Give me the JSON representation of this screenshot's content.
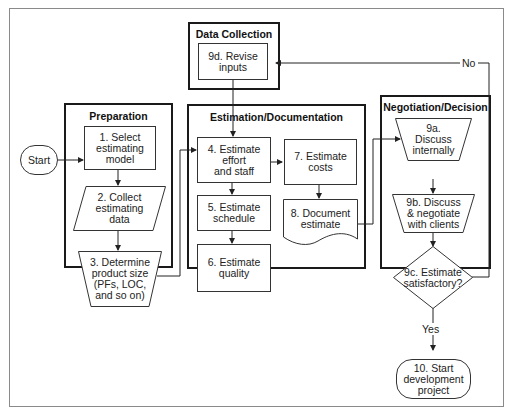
{
  "diagram": {
    "groups": {
      "data_collection": {
        "title": "Data Collection"
      },
      "preparation": {
        "title": "Preparation"
      },
      "estimation": {
        "title": "Estimation/Documentation"
      },
      "negotiation": {
        "title": "Negotiation/Decision"
      }
    },
    "nodes": {
      "start": {
        "label": "Start",
        "shape": "terminator"
      },
      "n1": {
        "label": "1. Select\nestimating\nmodel",
        "shape": "process"
      },
      "n2": {
        "label": "2. Collect\nestimating\ndata",
        "shape": "data"
      },
      "n3": {
        "label": "3. Determine\nproduct size\n(PFs, LOC,\nand so on)",
        "shape": "manual-operation"
      },
      "n4": {
        "label": "4. Estimate\neffort\nand staff",
        "shape": "process"
      },
      "n5": {
        "label": "5. Estimate\nschedule",
        "shape": "process"
      },
      "n6": {
        "label": "6. Estimate\nquality",
        "shape": "process"
      },
      "n7": {
        "label": "7. Estimate\ncosts",
        "shape": "process"
      },
      "n8": {
        "label": "8. Document\nestimate",
        "shape": "document"
      },
      "n9a": {
        "label": "9a.\nDiscuss\ninternally",
        "shape": "manual-operation"
      },
      "n9b": {
        "label": "9b. Discuss\n& negotiate\nwith clients",
        "shape": "manual-operation"
      },
      "n9c": {
        "label": "9c. Estimate\nsatisfactory?",
        "shape": "decision"
      },
      "n9d": {
        "label": "9d. Revise\ninputs",
        "shape": "process"
      },
      "n10": {
        "label": "10. Start\ndevelopment\nproject",
        "shape": "terminator"
      }
    },
    "edges": [
      {
        "from": "start",
        "to": "n1"
      },
      {
        "from": "n1",
        "to": "n2"
      },
      {
        "from": "n2",
        "to": "n3"
      },
      {
        "from": "n3",
        "to": "n4"
      },
      {
        "from": "n4",
        "to": "n5"
      },
      {
        "from": "n5",
        "to": "n6"
      },
      {
        "from": "n4",
        "to": "n7"
      },
      {
        "from": "n7",
        "to": "n8"
      },
      {
        "from": "n8",
        "to": "n9a"
      },
      {
        "from": "n9a",
        "to": "n9b"
      },
      {
        "from": "n9b",
        "to": "n9c"
      },
      {
        "from": "n9c",
        "to": "n10",
        "label": "Yes"
      },
      {
        "from": "n9c",
        "to": "n9d",
        "label": "No"
      },
      {
        "from": "n9d",
        "to": "n4"
      }
    ],
    "edge_labels": {
      "yes": "Yes",
      "no": "No"
    },
    "colors": {
      "line": "#222222",
      "frame": "#8a8a8a",
      "background": "#ffffff"
    }
  }
}
